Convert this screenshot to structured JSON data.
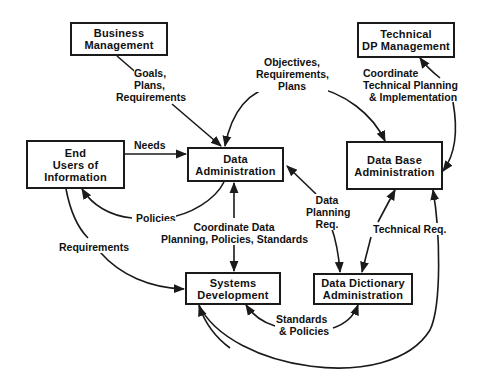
{
  "diagram": {
    "nodes": {
      "business_mgmt": {
        "line1": "Business",
        "line2": "Management"
      },
      "tech_dp_mgmt": {
        "line1": "Technical",
        "line2": "DP Management"
      },
      "end_users": {
        "line1": "End",
        "line2": "Users of",
        "line3": "Information"
      },
      "data_admin": {
        "line1": "Data",
        "line2": "Administration"
      },
      "db_admin": {
        "line1": "Data Base",
        "line2": "Administration"
      },
      "systems_dev": {
        "line1": "Systems",
        "line2": "Development"
      },
      "data_dict_admin": {
        "line1": "Data Dictionary",
        "line2": "Administration"
      }
    },
    "edges": {
      "goals": {
        "line1": "Goals,",
        "line2": "Plans,",
        "line3": "Requirements"
      },
      "objectives": {
        "line1": "Objectives,",
        "line2": "Requirements,",
        "line3": "Plans"
      },
      "coordinate_tech": {
        "line1": "Coordinate",
        "line2": "Technical Planning",
        "line3": "& Implementation"
      },
      "needs": {
        "line1": "Needs"
      },
      "policies": {
        "line1": "Policies"
      },
      "requirements": {
        "line1": "Requirements"
      },
      "coordinate_data": {
        "line1": "Coordinate Data",
        "line2": "Planning, Policies, Standards"
      },
      "data_planning": {
        "line1": "Data",
        "line2": "Planning",
        "line3": "Req."
      },
      "technical_req": {
        "line1": "Technical Req."
      },
      "standards_policies": {
        "line1": "Standards",
        "line2": "& Policies"
      }
    }
  }
}
